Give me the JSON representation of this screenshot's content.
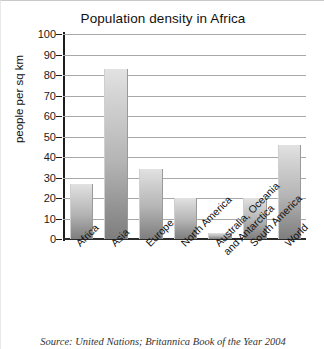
{
  "chart_data": {
    "type": "bar",
    "title": "Population density in Africa",
    "xlabel": "",
    "ylabel": "people per sq km",
    "ylim": [
      0,
      100
    ],
    "ytick_step": 10,
    "ytick_labels": [
      "100",
      "90",
      "80",
      "70",
      "60",
      "50",
      "40",
      "30",
      "20",
      "10",
      "0"
    ],
    "grid": true,
    "legend": false,
    "categories": [
      "Africa",
      "Asia",
      "Europe",
      "North America",
      "Australia, Oceania and Antarctica",
      "South America",
      "World"
    ],
    "category_lines": [
      [
        "Africa"
      ],
      [
        "Asia"
      ],
      [
        "Europe"
      ],
      [
        "North America"
      ],
      [
        "Australia, Oceania",
        "and Antarctica"
      ],
      [
        "South America"
      ],
      [
        "World"
      ]
    ],
    "values": [
      27,
      83,
      34,
      20,
      3,
      20,
      46
    ],
    "bar_color_top": "#e2e2e2",
    "bar_color_bottom": "#7e7e7e"
  },
  "annotations": {
    "source": "Source: United Nations; Britannica Book of the Year 2004"
  }
}
